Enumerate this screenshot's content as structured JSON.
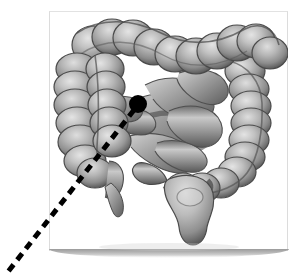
{
  "figure": {
    "style": "grayscale medical illustration on white card",
    "background_color": "#ffffff",
    "card": {
      "background_color": "#ffffff",
      "border_color": "#dcdcdc",
      "shadow_color": "#9b9b9b",
      "x": 49,
      "y": 11,
      "width": 239,
      "height": 240
    },
    "marker": {
      "name": "location-marker-dot",
      "shape": "filled circle",
      "color": "#000000",
      "center_x": 138,
      "center_y": 104,
      "radius": 9
    },
    "leader_line": {
      "name": "dashed-leader-line",
      "style": "dashed",
      "color": "#000000",
      "stroke_width": 5,
      "dash_length": 8,
      "gap_length": 6,
      "start_x": 134,
      "start_y": 110,
      "end_x": 7,
      "end_y": 273
    },
    "anatomy_parts": [
      {
        "name": "transverse-colon",
        "description": "haustrated arch across the top"
      },
      {
        "name": "ascending-colon",
        "description": "haustrated column on the left side"
      },
      {
        "name": "descending-colon",
        "description": "haustrated column on the right side"
      },
      {
        "name": "cecum",
        "description": "pouch at lower left"
      },
      {
        "name": "appendix",
        "description": "small tapering tube below the cecum"
      },
      {
        "name": "small-intestine",
        "description": "smooth coiled loops in the centre"
      },
      {
        "name": "sigmoid-colon",
        "description": "S-shaped segment at lower centre"
      },
      {
        "name": "rectum",
        "description": "tapering tube descending at bottom centre"
      }
    ],
    "palette": {
      "tissue_highlight": "#dcdcdc",
      "tissue_midtone": "#a8a8a8",
      "tissue_shadow": "#5e5e5e",
      "tissue_deep_shadow": "#3a3a3a",
      "outline": "#4a4a4a"
    }
  }
}
